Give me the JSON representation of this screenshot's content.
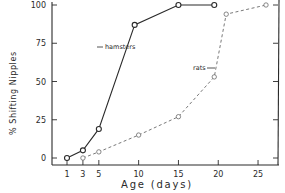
{
  "chart_data": {
    "type": "line",
    "title": "",
    "xlabel": "Age  (days)",
    "ylabel": "%  Shifting  Nipples",
    "xlim": [
      0,
      26.5
    ],
    "ylim": [
      0,
      100
    ],
    "x_ticks": [
      1,
      3,
      5,
      10,
      15,
      20,
      25
    ],
    "y_ticks": [
      0,
      25,
      50,
      75,
      100
    ],
    "grid": false,
    "legend": "inline labels",
    "series": [
      {
        "name": "hamsters",
        "style": "solid",
        "marker": "open-circle",
        "x": [
          1,
          3,
          5,
          9.5,
          15,
          19.5
        ],
        "values": [
          0,
          5,
          19,
          87,
          100,
          100
        ]
      },
      {
        "name": "rats",
        "style": "dashed",
        "marker": "open-circle",
        "x": [
          3,
          5,
          10,
          15,
          19.5,
          21,
          26
        ],
        "values": [
          0,
          4,
          15,
          27,
          53,
          94,
          100
        ]
      }
    ]
  },
  "labels": {
    "ylabel": "%  Shifting  Nipples",
    "xlabel": "Age  (days)",
    "hamsters": "hamsters",
    "rats": "rats"
  },
  "colors": {
    "ink": "#2a2a2a",
    "dashed": "#6a6a6a",
    "background": "#ffffff"
  }
}
